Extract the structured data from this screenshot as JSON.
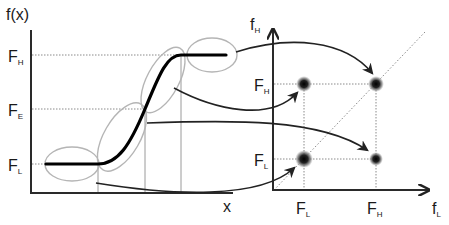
{
  "left_plot": {
    "y_axis_label": "f(x)",
    "x_axis_label": "x",
    "levels": [
      {
        "key": "high",
        "main": "F",
        "sub": "H"
      },
      {
        "key": "edge",
        "main": "F",
        "sub": "E"
      },
      {
        "key": "low",
        "main": "F",
        "sub": "L"
      }
    ]
  },
  "right_plot": {
    "y_axis_label": {
      "main": "f",
      "sub": "H"
    },
    "x_axis_label": {
      "main": "f",
      "sub": "L"
    },
    "y_ticks": [
      {
        "main": "F",
        "sub": "H"
      },
      {
        "main": "F",
        "sub": "L"
      }
    ],
    "x_ticks": [
      {
        "main": "F",
        "sub": "L"
      },
      {
        "main": "F",
        "sub": "H"
      }
    ],
    "clusters": [
      "(F_L, F_H)",
      "(F_H, F_H)",
      "(F_L, F_L)",
      "(F_H, F_L)"
    ]
  },
  "colors": {
    "axis": "#2a2a2a",
    "curve": "#000000",
    "ellipse": "#b5b5b5",
    "guide": "#8a8a8a"
  }
}
